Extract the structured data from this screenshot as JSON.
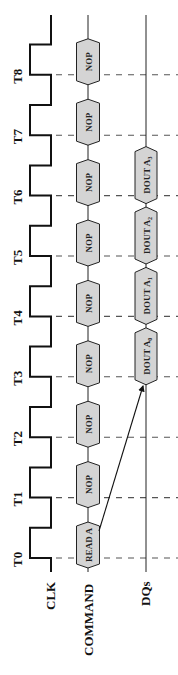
{
  "diagram": {
    "signals": {
      "clk": "CLK",
      "command": "COMMAND",
      "dqs": "DQs"
    },
    "clock_ticks": [
      "T0",
      "T1",
      "T2",
      "T3",
      "T4",
      "T5",
      "T6",
      "T7",
      "T8"
    ],
    "commands": [
      {
        "tick": "T0",
        "label": "READ A"
      },
      {
        "tick": "T1",
        "label": "NOP"
      },
      {
        "tick": "T2",
        "label": "NOP"
      },
      {
        "tick": "T3",
        "label": "NOP"
      },
      {
        "tick": "T4",
        "label": "NOP"
      },
      {
        "tick": "T5",
        "label": "NOP"
      },
      {
        "tick": "T6",
        "label": "NOP"
      },
      {
        "tick": "T7",
        "label": "NOP"
      },
      {
        "tick": "T8",
        "label": "NOP"
      }
    ],
    "data_out": [
      {
        "label": "DOUT A",
        "sub": "0"
      },
      {
        "label": "DOUT A",
        "sub": "1"
      },
      {
        "label": "DOUT A",
        "sub": "2"
      },
      {
        "label": "DOUT A",
        "sub": "3"
      }
    ],
    "arrow": {
      "from": "READ A",
      "to": "DOUT A0"
    },
    "colors": {
      "box_fill": "#d4d4d4",
      "stroke": "#222222",
      "dash": "#555555"
    }
  }
}
